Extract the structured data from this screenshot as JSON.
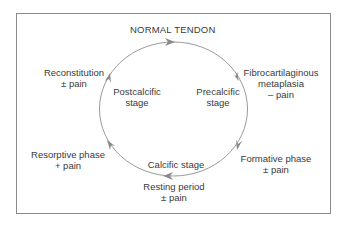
{
  "diagram": {
    "title": "NORMAL TENDON",
    "colors": {
      "frame": "#8a8a8a",
      "cycle_line": "#9a9a9a",
      "arrow": "#8a8a8a",
      "text": "#3a3a3a"
    },
    "stages": {
      "precalcific": {
        "line1": "Precalcific",
        "line2": "stage"
      },
      "calcific": {
        "line1": "Calcific stage"
      },
      "postcalcific": {
        "line1": "Postcalcific",
        "line2": "stage"
      }
    },
    "phases": {
      "fibrocartilaginous": {
        "line1": "Fibrocartilaginous",
        "line2": "metaplasia",
        "line3": "– pain"
      },
      "formative": {
        "line1": "Formative phase",
        "line2": "± pain"
      },
      "resting": {
        "line1": "Resting period",
        "line2": "± pain"
      },
      "resorptive": {
        "line1": "Resorptive phase",
        "line2": "+ pain"
      },
      "reconstitution": {
        "line1": "Reconstitution",
        "line2": "± pain"
      }
    },
    "cycle_direction": "clockwise",
    "arrow_icons": [
      "arrow-top",
      "arrow-upper-right",
      "arrow-lower-right",
      "arrow-bottom",
      "arrow-lower-left",
      "arrow-upper-left"
    ]
  }
}
